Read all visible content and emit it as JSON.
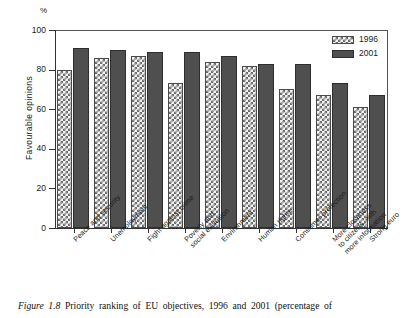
{
  "unit_label": "%",
  "y_axis_title": "Favourable  opinions",
  "caption": {
    "figure_label": "Figure 1.8",
    "text": "Priority ranking of EU objectives, 1996 and 2001 (percentage of"
  },
  "legend": {
    "position": "top-right",
    "entries": [
      {
        "label": "1996",
        "swatch": "checkered-hatch-swatch",
        "color": "#6b6b6b"
      },
      {
        "label": "2001",
        "swatch": "solid-dark-swatch",
        "color": "#4f4f4f"
      }
    ]
  },
  "y_ticks": [
    "0",
    "20",
    "40",
    "60",
    "80",
    "100"
  ],
  "chart_data": {
    "type": "bar",
    "title": "Priority ranking of EU objectives, 1996 and 2001 (percentage of",
    "xlabel": "",
    "ylabel": "Favourable opinions",
    "unit": "%",
    "ylim": [
      0,
      100
    ],
    "yticks": [
      0,
      20,
      40,
      60,
      80,
      100
    ],
    "grid": false,
    "legend_position": "top-right",
    "categories": [
      "Peace and security",
      "Unemployment",
      "Fight against crime",
      "Poverty and social exclusion",
      "Environment",
      "Human rights",
      "Consumer protection",
      "More closeness to citizens, with more information",
      "Strong euro"
    ],
    "category_lines": [
      [
        "Peace and security"
      ],
      [
        "Unemployment"
      ],
      [
        "Fight against crime"
      ],
      [
        "Poverty and",
        "social exclusion"
      ],
      [
        "Environment"
      ],
      [
        "Human rights"
      ],
      [
        "Consumer protection"
      ],
      [
        "More closeness",
        "to citizens, with",
        "more information"
      ],
      [
        "Strong euro"
      ]
    ],
    "series": [
      {
        "name": "1996",
        "color": "#6b6b6b",
        "pattern": "checkered",
        "values": [
          80,
          86,
          87,
          73,
          84,
          82,
          70,
          67,
          61
        ]
      },
      {
        "name": "2001",
        "color": "#4f4f4f",
        "pattern": "solid",
        "values": [
          91,
          90,
          89,
          89,
          87,
          83,
          83,
          73,
          67
        ]
      }
    ]
  }
}
